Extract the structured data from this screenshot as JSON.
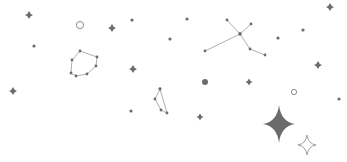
{
  "illustration": {
    "name": "starry-sky",
    "width": 347,
    "height": 162,
    "colors": {
      "background": "#ffffff",
      "star": "#6b6b6b",
      "line": "#9a9a9a",
      "outline": "#8a8a8a"
    },
    "sparkles_small": [
      {
        "x": 29,
        "y": 15,
        "r": 4
      },
      {
        "x": 112,
        "y": 28,
        "r": 4
      },
      {
        "x": 133,
        "y": 69,
        "r": 4
      },
      {
        "x": 13,
        "y": 91,
        "r": 4
      },
      {
        "x": 200,
        "y": 117,
        "r": 3.5
      },
      {
        "x": 330,
        "y": 7,
        "r": 4
      },
      {
        "x": 318,
        "y": 65,
        "r": 4
      },
      {
        "x": 249,
        "y": 82,
        "r": 3.5
      }
    ],
    "dots": [
      {
        "x": 34,
        "y": 46,
        "r": 1.6
      },
      {
        "x": 132,
        "y": 20,
        "r": 1.6
      },
      {
        "x": 187,
        "y": 19,
        "r": 1.6
      },
      {
        "x": 170,
        "y": 39,
        "r": 1.6
      },
      {
        "x": 278,
        "y": 38,
        "r": 1.6
      },
      {
        "x": 303,
        "y": 30,
        "r": 1.6
      },
      {
        "x": 131,
        "y": 111,
        "r": 1.6
      },
      {
        "x": 339,
        "y": 99,
        "r": 1.6
      }
    ],
    "hollow_circles": [
      {
        "x": 80,
        "y": 25,
        "r": 3.6
      },
      {
        "x": 294,
        "y": 92,
        "r": 2.6
      }
    ],
    "filled_circles": [
      {
        "x": 205,
        "y": 82,
        "r": 3
      }
    ],
    "big_star": {
      "x": 279,
      "y": 124,
      "rx": 16,
      "ry": 19
    },
    "outline_star": {
      "x": 307,
      "y": 145,
      "rx": 9,
      "ry": 10
    },
    "constellations": [
      {
        "name": "polygon",
        "points": [
          [
            80,
            51
          ],
          [
            97,
            57
          ],
          [
            96,
            66
          ],
          [
            87,
            74
          ],
          [
            76,
            76
          ],
          [
            71,
            73
          ],
          [
            72,
            60
          ]
        ],
        "closed": true
      },
      {
        "name": "cross",
        "points": [
          [
            227,
            20
          ],
          [
            240,
            34
          ],
          [
            251,
            24
          ]
        ],
        "closed": false,
        "extra_segments": [
          [
            [
              205,
              51
            ],
            [
              240,
              34
            ]
          ],
          [
            [
              240,
              34
            ],
            [
              250,
              49
            ],
            [
              265,
              55
            ]
          ]
        ]
      },
      {
        "name": "small",
        "points": [
          [
            160,
            89
          ],
          [
            155,
            99
          ],
          [
            161,
            110
          ],
          [
            167,
            113
          ],
          [
            160,
            89
          ]
        ],
        "closed": false
      }
    ]
  }
}
